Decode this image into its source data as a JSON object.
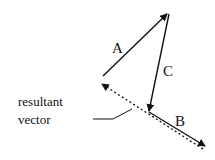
{
  "diagram": {
    "type": "vector-addition",
    "colors": {
      "stroke": "#111111",
      "background": "#ffffff"
    },
    "vectors": [
      {
        "name": "A",
        "label": "A",
        "from": [
          103,
          76
        ],
        "to": [
          168,
          13
        ],
        "style": "solid"
      },
      {
        "name": "C",
        "label": "C",
        "from": [
          169,
          14
        ],
        "to": [
          149,
          112
        ],
        "style": "solid"
      },
      {
        "name": "B",
        "label": "B",
        "from": [
          149,
          112
        ],
        "to": [
          206,
          147
        ],
        "style": "solid"
      },
      {
        "name": "resultant",
        "label": "",
        "from": [
          203,
          149
        ],
        "to": [
          101,
          83
        ],
        "style": "dotted"
      }
    ],
    "labels": {
      "a": "A",
      "b": "B",
      "c": "C",
      "resultant_line1": "resultant",
      "resultant_line2": "vector"
    },
    "leader_line": {
      "points": [
        [
          93,
          119
        ],
        [
          113,
          119
        ],
        [
          132,
          109
        ]
      ]
    }
  }
}
